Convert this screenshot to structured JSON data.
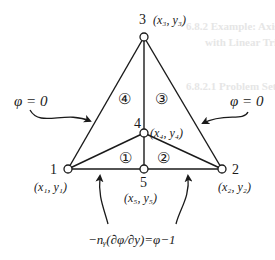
{
  "figure": {
    "nodes": [
      {
        "id": "1",
        "label": "1",
        "coord": "(x₁, y₁)",
        "x": 68,
        "y": 169
      },
      {
        "id": "2",
        "label": "2",
        "coord": "(x₂, y₂)",
        "x": 222,
        "y": 169
      },
      {
        "id": "3",
        "label": "3",
        "coord": "(x₃, y₃)",
        "x": 144,
        "y": 37
      },
      {
        "id": "4",
        "label": "4",
        "coord": "(x₄, y₄)",
        "x": 144,
        "y": 133
      },
      {
        "id": "5",
        "label": "5",
        "coord": "(x₅, y₅)",
        "x": 144,
        "y": 169
      }
    ],
    "elements": [
      {
        "id": "1",
        "label": "①"
      },
      {
        "id": "2",
        "label": "②"
      },
      {
        "id": "3",
        "label": "③"
      },
      {
        "id": "4",
        "label": "④"
      }
    ],
    "boundary_conditions": {
      "left": "φ = 0",
      "right": "φ = 0",
      "bottom": "−nᵧ(∂φ/∂y)=φ−1"
    }
  },
  "background_bleed": {
    "line1": "6.8.2  Example: Axis-Symmetric and 2-D",
    "line2": "with Linear Triangular Elements",
    "line3": "6.8.2.1  Problem Set"
  }
}
